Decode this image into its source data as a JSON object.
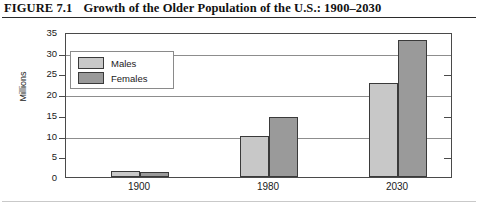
{
  "figure": {
    "label": "FIGURE 7.1",
    "title": "Growth of the Older Population of the U.S.: 1900–2030"
  },
  "axis": {
    "y_title": "Millions",
    "y_ticks": [
      "35",
      "30",
      "25",
      "20",
      "15",
      "10",
      "5",
      "0"
    ]
  },
  "legend": {
    "items": [
      {
        "label": "Males",
        "color": "#c8c8c8"
      },
      {
        "label": "Females",
        "color": "#9a9a9a"
      }
    ]
  },
  "chart_data": {
    "type": "bar",
    "title": "Growth of the Older Population of the U.S.: 1900–2030",
    "xlabel": "",
    "ylabel": "Millions",
    "ylim": [
      0,
      35
    ],
    "ytick_step": 5,
    "grid": true,
    "gridlines_at": [
      10,
      20,
      30
    ],
    "legend_position": "top-left-inside",
    "categories": [
      "1900",
      "1980",
      "2030"
    ],
    "series": [
      {
        "name": "Males",
        "color": "#c8c8c8",
        "values": [
          1.5,
          10.0,
          22.7
        ]
      },
      {
        "name": "Females",
        "color": "#9a9a9a",
        "values": [
          1.2,
          14.5,
          33.0
        ]
      }
    ]
  }
}
